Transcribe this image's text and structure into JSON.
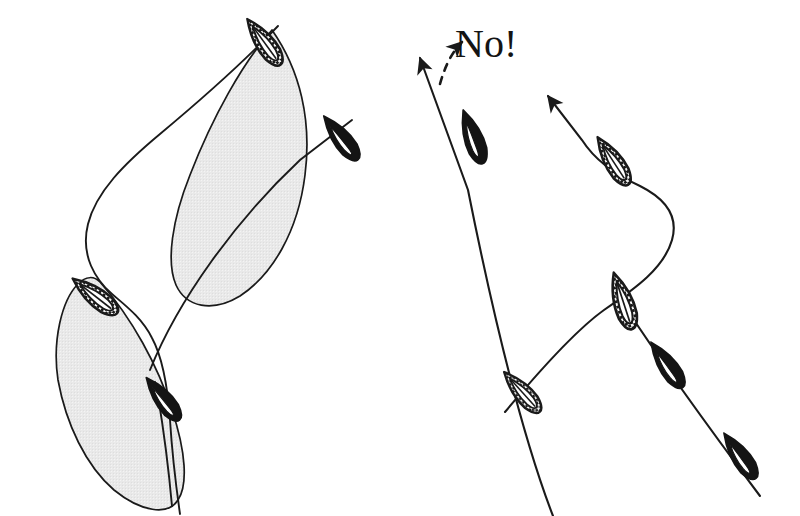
{
  "figure": {
    "background_color": "#ffffff",
    "ink_color": "#1a1a1a",
    "shade_color": "#e7e7e7",
    "shade_edge_color": "#1a1a1a",
    "annotation": {
      "text": "No!",
      "color": "#141414",
      "x": 455,
      "y": 24,
      "font_size_px": 40
    },
    "panels": [
      {
        "name": "left-panel",
        "label": "permitted-crossing",
        "has_shaded_zones": true,
        "has_annotation": false,
        "boats": [
          {
            "id": "left-upper-checkered",
            "style": "checkered",
            "cx": 264,
            "cy": 42,
            "angle_deg": -36,
            "length": 62,
            "width": 22
          },
          {
            "id": "left-black-right",
            "style": "solid-black",
            "cx": 341,
            "cy": 138,
            "angle_deg": -38,
            "length": 58,
            "width": 24
          },
          {
            "id": "left-lower-checkered",
            "style": "checkered",
            "cx": 95,
            "cy": 296,
            "angle_deg": -52,
            "length": 62,
            "width": 22
          },
          {
            "id": "left-black-lower",
            "style": "solid-black",
            "cx": 163,
            "cy": 399,
            "angle_deg": -38,
            "length": 56,
            "width": 24
          }
        ],
        "shaded_zones": [
          {
            "id": "zone-upper",
            "description": "wind shadow cone from upper checkered boat"
          },
          {
            "id": "zone-lower",
            "description": "wind shadow cone from lower checkered boat"
          }
        ],
        "tracks": [
          {
            "id": "track-checkered-left",
            "description": "curving track of checkered boat, upper-right to lower-left"
          },
          {
            "id": "track-black-left",
            "description": "straight track of black boat, lower-left to upper-right"
          }
        ]
      },
      {
        "name": "right-panel",
        "label": "forbidden-crossing",
        "has_shaded_zones": false,
        "has_annotation": true,
        "boats": [
          {
            "id": "right-black-upper",
            "style": "solid-black",
            "cx": 473,
            "cy": 137,
            "angle_deg": -62,
            "length": 62,
            "width": 24
          },
          {
            "id": "right-checkered-upper",
            "style": "checkered",
            "cx": 613,
            "cy": 161,
            "angle_deg": -62,
            "length": 62,
            "width": 24
          },
          {
            "id": "right-checkered-center",
            "style": "checkered",
            "cx": 623,
            "cy": 301,
            "angle_deg": -62,
            "length": 64,
            "width": 24
          },
          {
            "id": "right-checkered-lower-left",
            "style": "checkered",
            "cx": 522,
            "cy": 392,
            "angle_deg": -56,
            "length": 58,
            "width": 22
          },
          {
            "id": "right-black-mid",
            "style": "solid-black",
            "cx": 667,
            "cy": 365,
            "angle_deg": -55,
            "length": 58,
            "width": 24
          },
          {
            "id": "right-black-lower",
            "style": "solid-black",
            "cx": 740,
            "cy": 456,
            "angle_deg": -55,
            "length": 58,
            "width": 24
          }
        ],
        "arrows": [
          {
            "id": "arrow-black-track",
            "direction": "up-left",
            "style": "solid",
            "tip_x": 409,
            "tip_y": 45
          },
          {
            "id": "arrow-checkered-track",
            "direction": "up-left",
            "style": "solid",
            "tip_x": 540,
            "tip_y": 92
          },
          {
            "id": "arrow-dashed-warning",
            "direction": "up-right",
            "style": "dashed",
            "tip_x": 470,
            "tip_y": 31
          }
        ],
        "tracks": [
          {
            "id": "track-black-right",
            "description": "straight track of black boat running up-left"
          },
          {
            "id": "track-checkered-right",
            "description": "S-curving track of checkered boat crossing the black boat's track"
          }
        ]
      }
    ]
  }
}
